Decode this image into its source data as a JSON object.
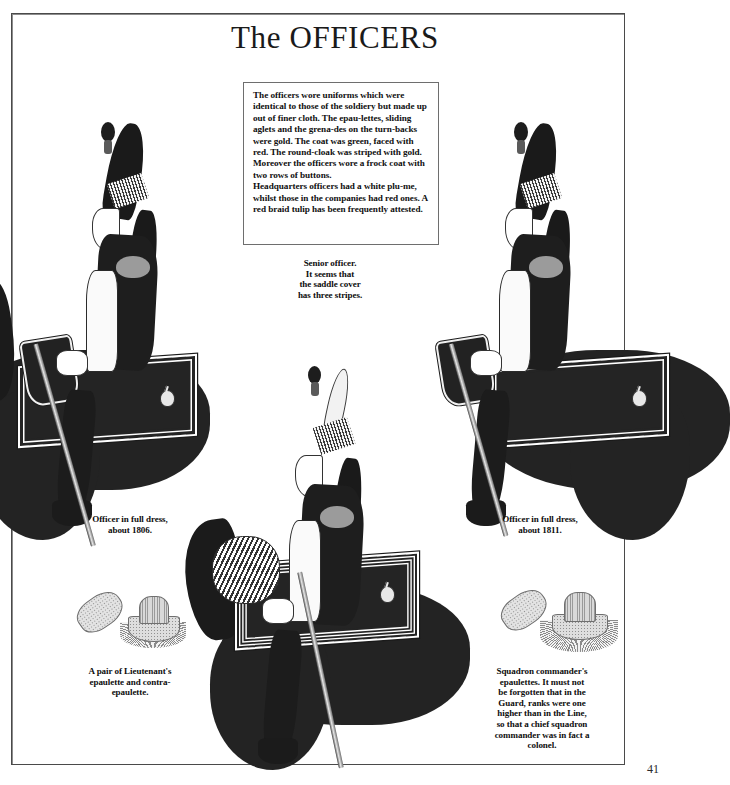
{
  "page": {
    "title": "The OFFICERS",
    "number": "41"
  },
  "description": {
    "text": "The officers wore uniforms which were identical to those of the soldiery but made up out of finer cloth. The epau-lettes, sliding aglets and the grena-des on the turn-backs were gold. The coat was green, faced with red. The round-cloak was striped with gold. Moreover the officers wore a frock coat with two rows of buttons.\nHeadquarters officers had a white plu-me, whilst those in the companies had red ones. A red braid tulip has been frequently attested."
  },
  "captions": {
    "center": "Senior officer.\nIt seems that\nthe saddle cover\nhas three stripes.",
    "left": "Officer in full dress,\nabout 1806.",
    "right": "Officer in full dress,\nabout 1811.",
    "epaulette_left": "A pair of Lieutenant's\nepaulette and contra-\nepaulette.",
    "epaulette_right": "Squadron commander's\nepaulettes. It must not\nbe forgotten that in the\nGuard, ranks were one\nhigher than in the Line,\nso that a chief squadron\ncommander was in fact a\ncolonel."
  },
  "figures": {
    "left_officer": {
      "name": "Officer in full dress, about 1806",
      "plume": "red/dark",
      "mount": "dark horse"
    },
    "center_officer": {
      "name": "Senior officer",
      "plume": "white",
      "mount": "dark horse"
    },
    "right_officer": {
      "name": "Officer in full dress, about 1811",
      "plume": "red/dark",
      "mount": "dark horse"
    },
    "epaulette_pair_left": {
      "name": "Lieutenant's epaulette and contra-epaulette"
    },
    "epaulette_pair_right": {
      "name": "Squadron commander's epaulettes"
    }
  },
  "colors": {
    "ink": "#1b1b1b",
    "paper": "#ffffff",
    "frame": "#4a4a4a",
    "text": "#101010"
  }
}
